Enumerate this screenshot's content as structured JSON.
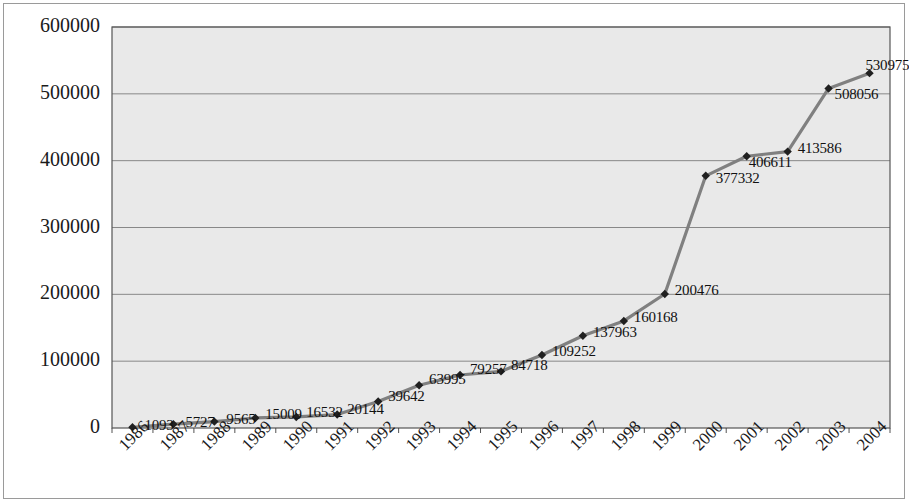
{
  "chart_data": {
    "type": "line",
    "title": "",
    "subtitle": "",
    "xlabel": "",
    "ylabel": "",
    "categories": [
      "1986",
      "1987",
      "1988",
      "1989",
      "1990",
      "1991",
      "1992",
      "1993",
      "1994",
      "1995",
      "1996",
      "1997",
      "1998",
      "1999",
      "2000",
      "2001",
      "2002",
      "2003",
      "2004"
    ],
    "values": [
      1093,
      5727,
      9565,
      15009,
      16532,
      20144,
      39642,
      63995,
      79257,
      84718,
      109252,
      137963,
      160168,
      200476,
      377332,
      406611,
      413586,
      508056,
      530975
    ],
    "point_labels": [
      "1093",
      "5727",
      "9565",
      "15009",
      "16532",
      "20144",
      "39642",
      "63995",
      "79257",
      "84718",
      "109252",
      "137963",
      "160168",
      "200476",
      "377332",
      "406611",
      "413586",
      "508056",
      "530975"
    ],
    "y_ticks": [
      0,
      100000,
      200000,
      300000,
      400000,
      500000,
      600000
    ],
    "y_tick_labels": [
      "0",
      "100000",
      "200000",
      "300000",
      "400000",
      "500000",
      "600000"
    ],
    "ylim": [
      0,
      600000
    ],
    "grid": true,
    "grid_axis": "y",
    "legend": false,
    "legend_position": "none",
    "marker": "diamond",
    "series": [
      {
        "name": "series-1",
        "values": [
          1093,
          5727,
          9565,
          15009,
          16532,
          20144,
          39642,
          63995,
          79257,
          84718,
          109252,
          137963,
          160168,
          200476,
          377332,
          406611,
          413586,
          508056,
          530975
        ]
      }
    ],
    "colors": {
      "line": "#808080",
      "marker": "#202020",
      "plot_background": "#e9e9e9",
      "grid": "#7d7d7d",
      "axis": "#404040",
      "text": "#1a1a1a",
      "page_background": "#ffffff",
      "border": "#9a9a9a"
    },
    "label_offsets": [
      {
        "dx": 12,
        "dy": -2
      },
      {
        "dx": 12,
        "dy": -2
      },
      {
        "dx": 12,
        "dy": -3
      },
      {
        "dx": 10,
        "dy": -4
      },
      {
        "dx": 10,
        "dy": -5
      },
      {
        "dx": 10,
        "dy": -6
      },
      {
        "dx": 10,
        "dy": -6
      },
      {
        "dx": 10,
        "dy": -6
      },
      {
        "dx": 10,
        "dy": -6
      },
      {
        "dx": 10,
        "dy": -6
      },
      {
        "dx": 10,
        "dy": -4
      },
      {
        "dx": 10,
        "dy": -4
      },
      {
        "dx": 10,
        "dy": -4
      },
      {
        "dx": 10,
        "dy": -4
      },
      {
        "dx": 10,
        "dy": 2
      },
      {
        "dx": 2,
        "dy": 6
      },
      {
        "dx": 10,
        "dy": -4
      },
      {
        "dx": 6,
        "dy": 6
      },
      {
        "dx": -4,
        "dy": -8
      }
    ]
  }
}
